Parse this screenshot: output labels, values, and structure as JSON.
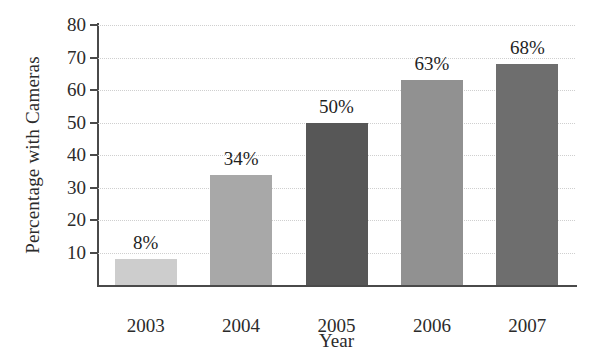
{
  "chart_data": {
    "type": "bar",
    "title": "",
    "xlabel": "Year",
    "ylabel": "Percentage with Cameras",
    "categories": [
      "2003",
      "2004",
      "2005",
      "2006",
      "2007"
    ],
    "values": [
      8,
      34,
      50,
      63,
      68
    ],
    "data_labels": [
      "8%",
      "34%",
      "50%",
      "63%",
      "68%"
    ],
    "bar_colors": [
      "#cdcdcd",
      "#a8a8a8",
      "#575757",
      "#919191",
      "#6e6e6e"
    ],
    "ylim": [
      0,
      80
    ],
    "yticks": [
      10,
      20,
      30,
      40,
      50,
      60,
      70,
      80
    ],
    "ytick_labels": [
      "10",
      "20",
      "30",
      "40",
      "50",
      "60",
      "70",
      "80"
    ],
    "grid": true,
    "grid_style": "dotted",
    "grid_color": "#cfcfcf",
    "legend": "none",
    "axis_color": "#4a4a4a",
    "background": "#ffffff"
  }
}
